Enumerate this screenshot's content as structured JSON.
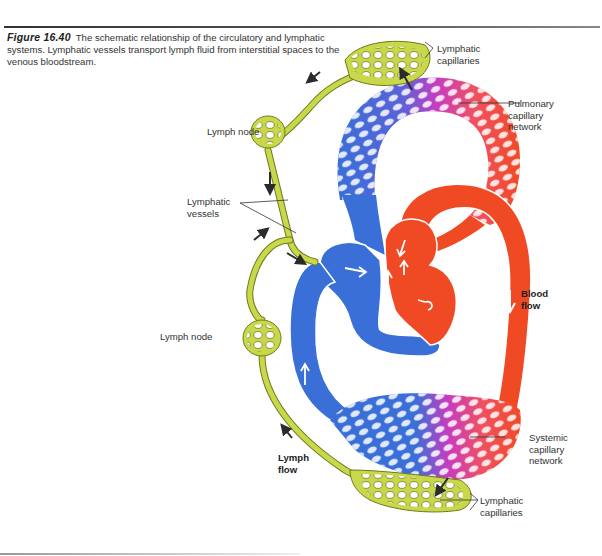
{
  "figure": {
    "number": "Figure 16.40",
    "caption": "The schematic relationship of the circulatory and lymphatic systems. Lymphatic vessels transport lymph fluid from interstitial spaces to the venous bloodstream."
  },
  "labels": {
    "lymphatic_capillaries_top": [
      "Lymphatic",
      "capillaries"
    ],
    "pulmonary_capillary_network": [
      "Pulmonary",
      "capillary",
      "network"
    ],
    "lymph_node_upper": "Lymph node",
    "lymphatic_vessels": [
      "Lymphatic",
      "vessels"
    ],
    "lymph_node_lower": "Lymph node",
    "blood_flow": [
      "Blood",
      "flow"
    ],
    "lymph_flow": [
      "Lymph",
      "flow"
    ],
    "systemic_capillary_network": [
      "Systemic",
      "capillary",
      "network"
    ],
    "lymphatic_capillaries_bottom": [
      "Lymphatic",
      "capillaries"
    ]
  },
  "colors": {
    "deoxygenated_blue": "#3a6fd8",
    "oxygenated_red": "#f04a25",
    "transition_magenta": "#c73cc0",
    "lymph_green": "#c8d84a",
    "lymph_outline": "#6f7a1c",
    "arrow": "#2b2b2b"
  }
}
